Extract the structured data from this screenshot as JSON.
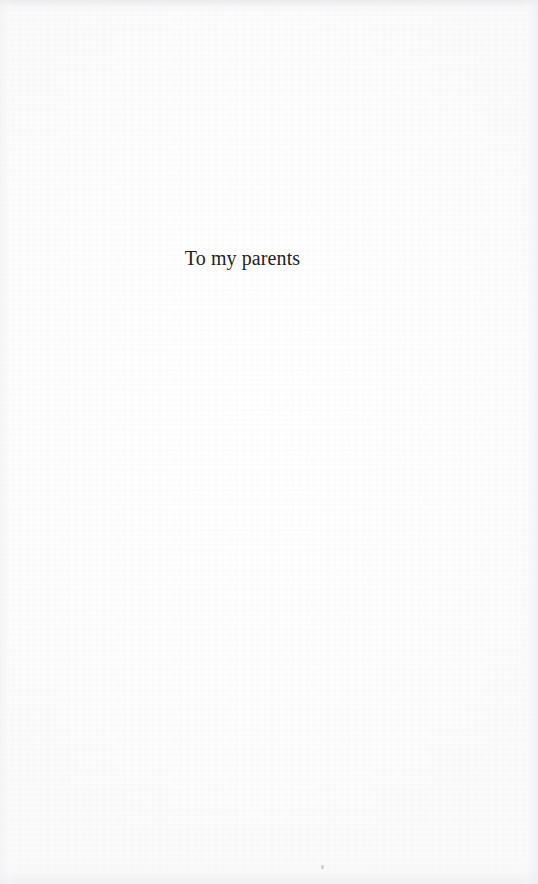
{
  "document": {
    "kind": "book-dedication-page",
    "page_width": 538,
    "page_height": 884,
    "background_color": "#fdfdfd",
    "text_color": "#1f1f21"
  },
  "dedication": {
    "text": "To my parents"
  },
  "artifacts": {
    "top_edge_band": "scan-edge-shading",
    "bottom_edge_band": "scan-edge-shading",
    "left_edge_band": "scan-edge-shading",
    "right_edge_band": "scan-edge-shading",
    "speck": "scan-dust-speck"
  }
}
